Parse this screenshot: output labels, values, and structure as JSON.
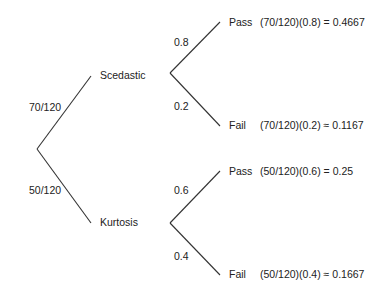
{
  "diagram": {
    "type": "probability-tree",
    "root": {
      "branches": [
        {
          "label": "Scedastic",
          "probability": "70/120",
          "branches": [
            {
              "outcome": "Pass",
              "probability": "0.8",
              "result": "(70/120)(0.8) = 0.4667"
            },
            {
              "outcome": "Fail",
              "probability": "0.2",
              "result": "(70/120)(0.2) ≈ 0.1167"
            }
          ]
        },
        {
          "label": "Kurtosis",
          "probability": "50/120",
          "branches": [
            {
              "outcome": "Pass",
              "probability": "0.6",
              "result": "(50/120)(0.6) = 0.25"
            },
            {
              "outcome": "Fail",
              "probability": "0.4",
              "result": "(50/120)(0.4) ≈ 0.1667"
            }
          ]
        }
      ]
    }
  }
}
